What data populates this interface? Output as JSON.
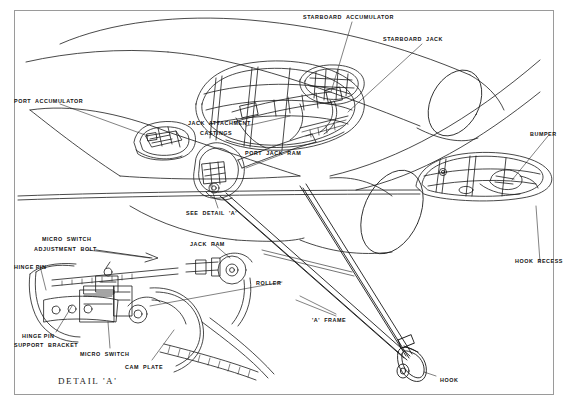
{
  "document": {
    "type": "technical-cutaway-illustration",
    "subject": "Aircraft arrester hook and jack installation",
    "background_color": "#ffffff",
    "line_color": "#1a1a1a",
    "frame_color": "#9a9a9a",
    "faint_caption": ""
  },
  "labels": [
    {
      "id": "starboard-accumulator",
      "text": "STARBOARD  ACCUMULATOR",
      "x": 303,
      "y": 14
    },
    {
      "id": "starboard-jack",
      "text": "STARBOARD  JACK",
      "x": 383,
      "y": 36
    },
    {
      "id": "port-accumulator",
      "text": "PORT  ACCUMULATOR",
      "x": 14,
      "y": 98
    },
    {
      "id": "jack-attachment-castings-1",
      "text": "JACK  ATTACHMENT",
      "x": 188,
      "y": 120
    },
    {
      "id": "jack-attachment-castings-2",
      "text": "CASTINGS",
      "x": 200,
      "y": 130
    },
    {
      "id": "port-jack-ram",
      "text": "PORT  JACK  RAM",
      "x": 245,
      "y": 150
    },
    {
      "id": "bumper",
      "text": "BUMPER",
      "x": 530,
      "y": 131
    },
    {
      "id": "see-detail-a",
      "text": "SEE  DETAIL  'A'",
      "x": 186,
      "y": 210
    },
    {
      "id": "hook-recess",
      "text": "HOOK  RECESS",
      "x": 515,
      "y": 258
    },
    {
      "id": "micro-switch-adj-1",
      "text": "MICRO  SWITCH",
      "x": 42,
      "y": 236
    },
    {
      "id": "micro-switch-adj-2",
      "text": "ADJUSTMENT  BOLT",
      "x": 34,
      "y": 246
    },
    {
      "id": "jack-ram",
      "text": "JACK  RAM",
      "x": 190,
      "y": 241
    },
    {
      "id": "hinge-pin",
      "text": "HINGE PIN",
      "x": 14,
      "y": 264
    },
    {
      "id": "roller",
      "text": "ROLLER",
      "x": 256,
      "y": 280
    },
    {
      "id": "a-frame",
      "text": "'A'  FRAME",
      "x": 312,
      "y": 317
    },
    {
      "id": "hinge-pin-support-1",
      "text": "HINGE PIN",
      "x": 22,
      "y": 333
    },
    {
      "id": "hinge-pin-support-2",
      "text": "SUPPORT  BRACKET",
      "x": 14,
      "y": 342
    },
    {
      "id": "micro-switch",
      "text": "MICRO  SWITCH",
      "x": 80,
      "y": 351
    },
    {
      "id": "cam-plate",
      "text": "CAM  PLATE",
      "x": 125,
      "y": 364
    },
    {
      "id": "hook",
      "text": "HOOK",
      "x": 440,
      "y": 377
    }
  ],
  "detail_title": {
    "text": "DETAIL 'A'",
    "x": 58,
    "y": 376
  }
}
